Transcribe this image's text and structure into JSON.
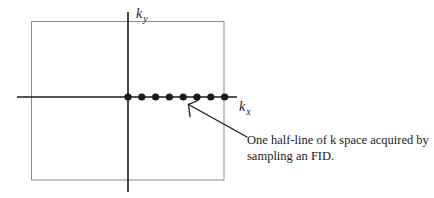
{
  "diagram": {
    "type": "k-space sampling diagram",
    "axes": {
      "horizontal": {
        "label_main": "k",
        "label_sub": "x"
      },
      "vertical": {
        "label_main": "k",
        "label_sub": "y"
      }
    },
    "sample_points": {
      "count": 8,
      "x_positions": [
        128,
        141.8,
        155.6,
        169.4,
        183.2,
        197,
        210.8,
        224.6
      ],
      "y": 97,
      "radius": 3.6
    },
    "annotation": {
      "lines": [
        "One half-line of k space acquired by",
        "sampling an FID."
      ]
    },
    "colors": {
      "axis": "#1a1a1a",
      "box": "#8c8c8c",
      "dots": "#1a1a1a",
      "text": "#1a1a1a",
      "background": "#ffffff"
    }
  }
}
